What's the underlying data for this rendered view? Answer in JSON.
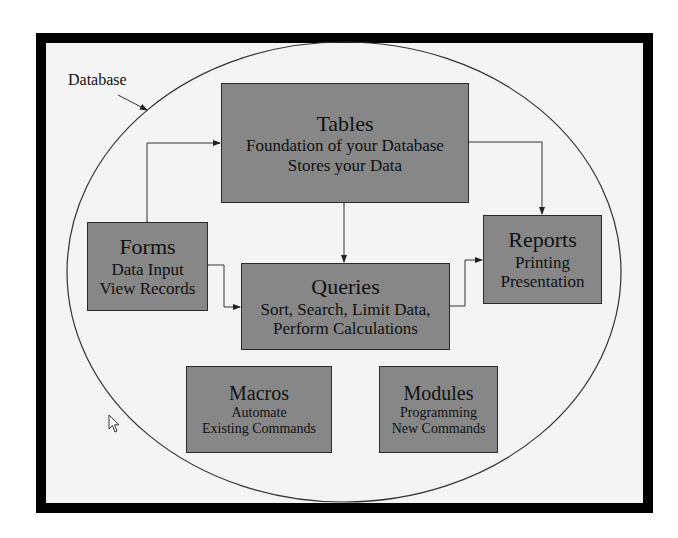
{
  "diagram": {
    "container_label": "Database",
    "colors": {
      "frame": "#000000",
      "background": "#f4f4f4",
      "box_fill": "#878787",
      "box_border": "#2a2a2a",
      "line": "#333333"
    },
    "nodes": {
      "tables": {
        "title": "Tables",
        "lines": [
          "Foundation of your Database",
          "Stores your Data"
        ]
      },
      "forms": {
        "title": "Forms",
        "lines": [
          "Data Input",
          "View Records"
        ]
      },
      "queries": {
        "title": "Queries",
        "lines": [
          "Sort, Search, Limit Data,",
          "Perform Calculations"
        ]
      },
      "reports": {
        "title": "Reports",
        "lines": [
          "Printing",
          "Presentation"
        ]
      },
      "macros": {
        "title": "Macros",
        "lines": [
          "Automate",
          "Existing Commands"
        ]
      },
      "modules": {
        "title": "Modules",
        "lines": [
          "Programming",
          "New Commands"
        ]
      }
    },
    "edges": [
      {
        "from": "tables",
        "to": "forms",
        "direction": "both"
      },
      {
        "from": "tables",
        "to": "queries",
        "direction": "both"
      },
      {
        "from": "tables",
        "to": "reports",
        "direction": "forward"
      },
      {
        "from": "forms",
        "to": "queries",
        "direction": "both"
      },
      {
        "from": "queries",
        "to": "reports",
        "direction": "forward"
      }
    ]
  }
}
